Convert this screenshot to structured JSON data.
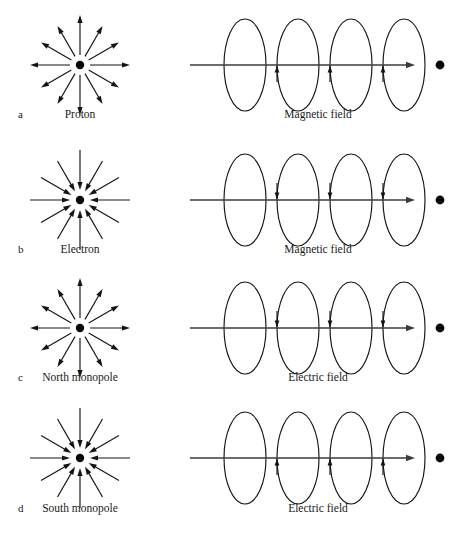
{
  "figure": {
    "background": "#ffffff",
    "ink": "#141414",
    "axis_color": "#3b3b3b",
    "width": 462,
    "height": 541,
    "rows": [
      {
        "key": "proton",
        "row_label": "a",
        "particle_caption": "Proton",
        "field_caption": "Magnetic field",
        "radial_direction": "outward",
        "loop_arrow_direction": "up",
        "center_y": 65,
        "caption_y": 118
      },
      {
        "key": "electron",
        "row_label": "b",
        "particle_caption": "Electron",
        "field_caption": "Magnetic field",
        "radial_direction": "inward",
        "loop_arrow_direction": "down",
        "center_y": 200,
        "caption_y": 253
      },
      {
        "key": "north-monopole",
        "row_label": "c",
        "particle_caption": "North monopole",
        "field_caption": "Electric field",
        "radial_direction": "outward",
        "loop_arrow_direction": "down",
        "center_y": 328,
        "caption_y": 381
      },
      {
        "key": "south-monopole",
        "row_label": "d",
        "particle_caption": "South monopole",
        "field_caption": "Electric field",
        "radial_direction": "inward",
        "loop_arrow_direction": "up",
        "center_y": 458,
        "caption_y": 512
      }
    ],
    "radial_panel": {
      "center_x": 80,
      "arrow_count": 12,
      "angle_step_degrees": 30,
      "inner_radius": 10,
      "cardinal_outer_radius": 50,
      "diagonal_outer_radius": 45,
      "core_dot_radius": 4.2,
      "arrowhead_length": 8,
      "arrowhead_half_width": 2.6
    },
    "field_panel": {
      "axis_start_x": 190,
      "axis_end_x": 415,
      "arrowhead_length": 9,
      "loop_center_xs": [
        245,
        298,
        351,
        404
      ],
      "loop_rx": 21,
      "loop_ry": 46,
      "loop_tick_offset_x": -21,
      "loop_tick_length": 17,
      "end_dot_x": 440,
      "end_dot_radius": 4.4
    },
    "row_label_x": 18,
    "particle_caption_x": 80,
    "field_caption_x": 318
  }
}
